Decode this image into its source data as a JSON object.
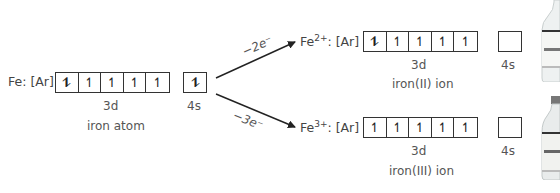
{
  "atom": {
    "label": "Fe: [Ar]",
    "orbital_3d": [
      "⥮",
      "↿",
      "↿",
      "↿",
      "↿"
    ],
    "orbital_4s": [
      "⥮"
    ],
    "label_3d": "3d",
    "label_4s": "4s",
    "caption": "iron atom"
  },
  "ion2": {
    "symbol": "Fe",
    "charge": "2+",
    "config": ": [Ar]",
    "orbital_3d": [
      "⥮",
      "↿",
      "↿",
      "↿",
      "↿"
    ],
    "orbital_4s": [
      ""
    ],
    "label_3d": "3d",
    "label_4s": "4s",
    "caption": "iron(II) ion",
    "arrow_label": "−2e⁻"
  },
  "ion3": {
    "symbol": "Fe",
    "charge": "3+",
    "config": ": [Ar]",
    "orbital_3d": [
      "↿",
      "↿",
      "↿",
      "↿",
      "↿"
    ],
    "orbital_4s": [
      ""
    ],
    "label_3d": "3d",
    "label_4s": "4s",
    "caption": "iron(III) ion",
    "arrow_label": "−3e⁻"
  },
  "images": {
    "bottle_top": "reagent-bottle",
    "bottle_bottom": "reagent-bottle"
  }
}
